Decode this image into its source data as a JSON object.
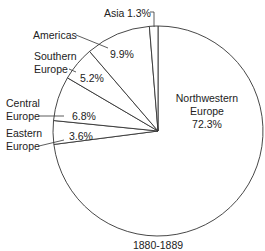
{
  "chart_data": {
    "type": "pie",
    "title": "1880-1889",
    "start_angle_deg": 0,
    "direction": "clockwise",
    "slices": [
      {
        "label": "Northwestern Europe",
        "value": 72.3,
        "value_label": "72.3%"
      },
      {
        "label": "Eastern Europe",
        "value": 3.6,
        "value_label": "3.6%"
      },
      {
        "label": "Central Europe",
        "value": 6.8,
        "value_label": "6.8%"
      },
      {
        "label": "Southern Europe",
        "value": 5.2,
        "value_label": "5.2%"
      },
      {
        "label": "Americas",
        "value": 9.9,
        "value_label": "9.9%"
      },
      {
        "label": "Asia",
        "value": 1.3,
        "value_label": "1.3%"
      }
    ],
    "colors": {
      "fill": "#ffffff",
      "stroke": "#333333",
      "text": "#222222"
    }
  },
  "labels": {
    "northwestern_line1": "Northwestern",
    "northwestern_line2": "Europe",
    "northwestern_pct": "72.3%",
    "eastern_line1": "Eastern",
    "eastern_line2": "Europe",
    "eastern_pct": "3.6%",
    "central_line1": "Central",
    "central_line2": "Europe",
    "central_pct": "6.8%",
    "southern_line1": "Southern",
    "southern_line2": "Europe",
    "southern_pct": "5.2%",
    "americas": "Americas",
    "americas_pct": "9.9%",
    "asia": "Asia",
    "asia_pct": "1.3%",
    "caption": "1880-1889"
  }
}
